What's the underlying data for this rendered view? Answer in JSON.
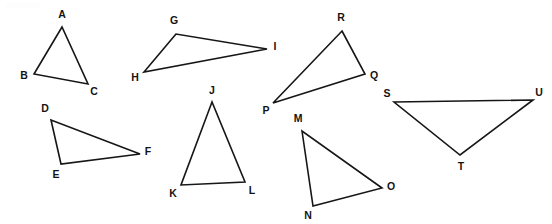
{
  "figure": {
    "width": 552,
    "height": 224,
    "background_color": "#ffffff",
    "stroke_color": "#161616",
    "label_color": "#131313",
    "stroke_width": 1.6,
    "label_font_size": 10.5
  },
  "chart_data": {
    "type": "diagram",
    "subtype": "geometric-figure-triangles",
    "xlabel": "",
    "ylabel": "",
    "grid": false,
    "legend": false,
    "coordinate_system": "image pixels, origin top-left, y increases downward",
    "shape_count": 8,
    "shapes": [
      {
        "name": "triangle-abc",
        "labels": [
          "A",
          "B",
          "C"
        ],
        "vertices": [
          [
            62,
            27
          ],
          [
            34,
            74
          ],
          [
            88,
            84
          ]
        ],
        "label_positions": [
          [
            62,
            15
          ],
          [
            24,
            76
          ],
          [
            94,
            92
          ]
        ]
      },
      {
        "name": "triangle-ghi",
        "labels": [
          "G",
          "H",
          "I"
        ],
        "vertices": [
          [
            176,
            34
          ],
          [
            144,
            72
          ],
          [
            267,
            49
          ]
        ],
        "label_positions": [
          [
            174,
            21
          ],
          [
            135,
            78
          ],
          [
            275,
            47
          ]
        ]
      },
      {
        "name": "triangle-pqr",
        "labels": [
          "R",
          "Q",
          "P"
        ],
        "vertices": [
          [
            342,
            31
          ],
          [
            365,
            74
          ],
          [
            273,
            103
          ]
        ],
        "label_positions": [
          [
            341,
            18
          ],
          [
            374,
            76
          ],
          [
            266,
            111
          ]
        ]
      },
      {
        "name": "triangle-def",
        "labels": [
          "D",
          "E",
          "F"
        ],
        "vertices": [
          [
            51,
            120
          ],
          [
            61,
            164
          ],
          [
            140,
            154
          ]
        ],
        "label_positions": [
          [
            45,
            109
          ],
          [
            56,
            175
          ],
          [
            148,
            152
          ]
        ]
      },
      {
        "name": "triangle-jkl",
        "labels": [
          "J",
          "K",
          "L"
        ],
        "vertices": [
          [
            212,
            102
          ],
          [
            181,
            185
          ],
          [
            245,
            182
          ]
        ],
        "label_positions": [
          [
            212,
            91
          ],
          [
            173,
            194
          ],
          [
            252,
            191
          ]
        ]
      },
      {
        "name": "triangle-mno",
        "labels": [
          "M",
          "N",
          "O"
        ],
        "vertices": [
          [
            302,
            131
          ],
          [
            313,
            206
          ],
          [
            382,
            188
          ]
        ],
        "label_positions": [
          [
            298,
            119
          ],
          [
            308,
            216
          ],
          [
            391,
            187
          ]
        ]
      },
      {
        "name": "triangle-stu",
        "labels": [
          "S",
          "U",
          "T"
        ],
        "vertices": [
          [
            394,
            102
          ],
          [
            533,
            100
          ],
          [
            460,
            155
          ]
        ],
        "label_positions": [
          [
            387,
            94
          ],
          [
            539,
            93
          ],
          [
            461,
            167
          ]
        ]
      }
    ],
    "vertex_labels": [
      "A",
      "B",
      "C",
      "D",
      "E",
      "F",
      "G",
      "H",
      "I",
      "J",
      "K",
      "L",
      "M",
      "N",
      "O",
      "P",
      "Q",
      "R",
      "S",
      "T",
      "U"
    ]
  }
}
